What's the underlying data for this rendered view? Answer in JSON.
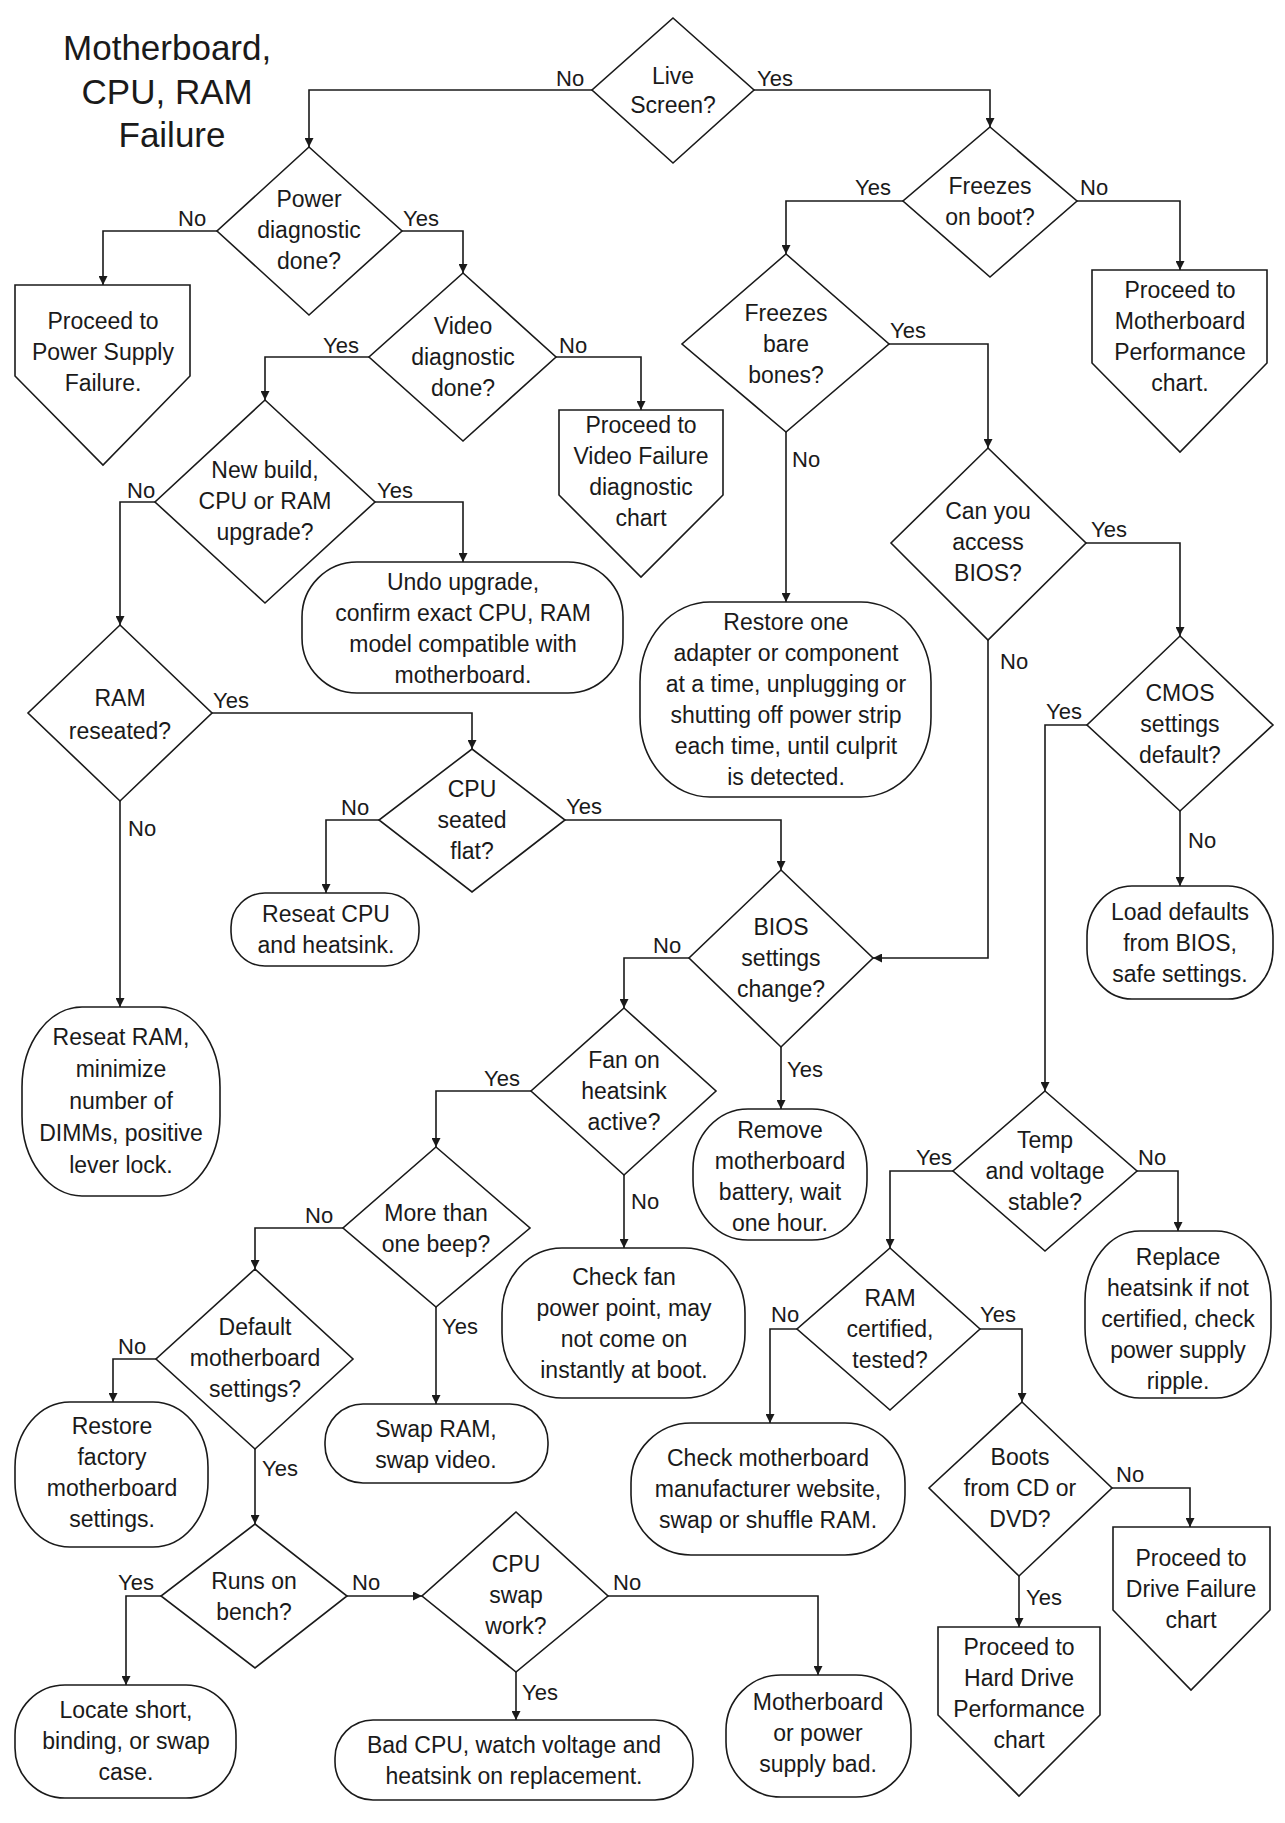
{
  "title": [
    "Motherboard,",
    "CPU, RAM",
    "Failure"
  ],
  "labels": {
    "yes": "Yes",
    "no": "No"
  },
  "nodes": {
    "live_screen": [
      "Live",
      "Screen?"
    ],
    "power_diag": [
      "Power",
      "diagnostic",
      "done?"
    ],
    "freezes_boot": [
      "Freezes",
      "on boot?"
    ],
    "power_supply_failure": [
      "Proceed to",
      "Power Supply",
      "Failure."
    ],
    "mb_performance": [
      "Proceed to",
      "Motherboard",
      "Performance",
      "chart."
    ],
    "video_diag": [
      "Video",
      "diagnostic",
      "done?"
    ],
    "freezes_bare": [
      "Freezes",
      "bare",
      "bones?"
    ],
    "video_failure": [
      "Proceed to",
      "Video Failure",
      "diagnostic",
      "chart"
    ],
    "new_build": [
      "New build,",
      "CPU or RAM",
      "upgrade?"
    ],
    "undo_upgrade": [
      "Undo upgrade,",
      "confirm  exact CPU, RAM",
      "model compatible with",
      "motherboard."
    ],
    "access_bios": [
      "Can you",
      "access",
      "BIOS?"
    ],
    "restore_one": [
      "Restore one",
      "adapter or component",
      "at a time, unplugging or",
      "shutting off power strip",
      "each time, until culprit",
      "is detected."
    ],
    "ram_reseated": [
      "RAM",
      "reseated?"
    ],
    "cmos_default": [
      "CMOS",
      "settings",
      "default?"
    ],
    "cpu_seated": [
      "CPU",
      "seated",
      "flat?"
    ],
    "reseat_cpu": [
      "Reseat CPU",
      "and heatsink."
    ],
    "load_defaults": [
      "Load defaults",
      "from BIOS,",
      "safe settings."
    ],
    "bios_change": [
      "BIOS",
      "settings",
      "change?"
    ],
    "reseat_ram": [
      "Reseat RAM,",
      "minimize",
      "number of",
      "DIMMs, positive",
      "lever lock."
    ],
    "fan_active": [
      "Fan on",
      "heatsink",
      "active?"
    ],
    "remove_battery": [
      "Remove",
      "motherboard",
      "battery, wait",
      "one hour."
    ],
    "temp_voltage": [
      "Temp",
      "and voltage",
      "stable?"
    ],
    "more_beep": [
      "More than",
      "one beep?"
    ],
    "check_fan": [
      "Check fan",
      "power point, may",
      "not come on",
      "instantly at boot."
    ],
    "replace_heatsink": [
      "Replace",
      "heatsink if not",
      "certified, check",
      "power supply",
      "ripple."
    ],
    "ram_certified": [
      "RAM",
      "certified,",
      "tested?"
    ],
    "default_mb": [
      "Default",
      "motherboard",
      "settings?"
    ],
    "restore_factory": [
      "Restore",
      "factory",
      "motherboard",
      "settings."
    ],
    "swap_ram_video": [
      "Swap RAM,",
      "swap video."
    ],
    "check_mb_site": [
      "Check motherboard",
      "manufacturer website,",
      "swap or shuffle RAM."
    ],
    "boots_cd": [
      "Boots",
      "from CD or",
      "DVD?"
    ],
    "drive_failure": [
      "Proceed to",
      "Drive Failure",
      "chart"
    ],
    "runs_bench": [
      "Runs on",
      "bench?"
    ],
    "cpu_swap": [
      "CPU",
      "swap",
      "work?"
    ],
    "hard_drive_perf": [
      "Proceed to",
      "Hard Drive",
      "Performance",
      "chart"
    ],
    "locate_short": [
      "Locate short,",
      "binding, or swap",
      "case."
    ],
    "bad_cpu": [
      "Bad CPU, watch voltage and",
      "heatsink on replacement."
    ],
    "mb_ps_bad": [
      "Motherboard",
      "or power",
      "supply bad."
    ]
  }
}
